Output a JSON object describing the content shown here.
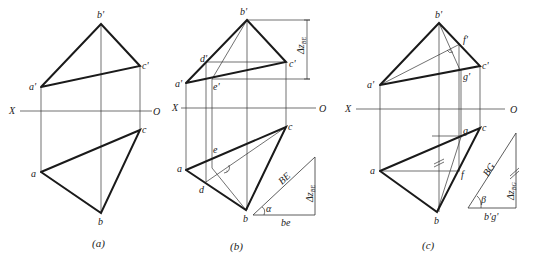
{
  "panels": [
    {
      "id": "a",
      "caption": "(a)",
      "axis": {
        "left": "X",
        "right": "O"
      },
      "points": {
        "b_prime": "b'",
        "c_prime": "c'",
        "a_prime": "a'",
        "a": "a",
        "b": "b",
        "c": "c"
      }
    },
    {
      "id": "b",
      "caption": "(b)",
      "axis": {
        "left": "X",
        "right": "O"
      },
      "points": {
        "b_prime": "b'",
        "d_prime": "d'",
        "c_prime": "c'",
        "a_prime": "a'",
        "e_prime": "e'",
        "a": "a",
        "b": "b",
        "c": "c",
        "d": "d",
        "e": "e"
      },
      "dimension": "Δz",
      "dimension_sub": "BE",
      "triangle": {
        "hypotenuse": "BE",
        "base": "be",
        "vertical": "Δz",
        "vertical_sub": "BE",
        "angle": "α"
      }
    },
    {
      "id": "c",
      "caption": "(c)",
      "axis": {
        "left": "X",
        "right": "O"
      },
      "points": {
        "b_prime": "b'",
        "f_prime": "f'",
        "c_prime": "c'",
        "g_prime": "g'",
        "a_prime": "a'",
        "a": "a",
        "b": "b",
        "c": "c",
        "f": "f",
        "g": "g"
      },
      "equal_mark": "//",
      "triangle": {
        "hypotenuse": "BG",
        "base": "b'g'",
        "vertical": "Δz",
        "vertical_sub": "BG",
        "angle": "β"
      }
    }
  ]
}
